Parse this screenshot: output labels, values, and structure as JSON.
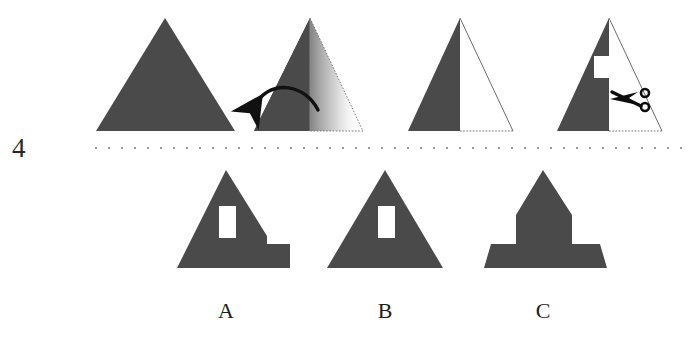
{
  "question": {
    "number": "4",
    "type": "paper-folding",
    "fill_color": "#4a4a4a",
    "outline_color": "#5a5a5a",
    "dash_color": "#8d8d8d",
    "background": "#ffffff"
  },
  "prompt_sequence": {
    "steps": [
      {
        "index": 1,
        "name": "unfolded-sheet",
        "description": "Solid gray equilateral triangle, unfolded paper",
        "icons": []
      },
      {
        "index": 2,
        "name": "fold-action",
        "description": "Right half of triangle folding leftwards over the vertical centre crease",
        "icons": [
          "fold-arrow-icon"
        ]
      },
      {
        "index": 3,
        "name": "folded-sheet",
        "description": "Paper folded in half; left half solid, right half shown as dotted outline",
        "icons": []
      },
      {
        "index": 4,
        "name": "cut-action",
        "description": "Rectangular notch cut out of the folded edge near mid height",
        "icons": [
          "scissors-icon"
        ]
      }
    ]
  },
  "options": [
    {
      "id": "A",
      "label": "A",
      "name": "option-a",
      "description": "Triangle with a white rectangular hole left of centre and a stepped bump on the lower right edge"
    },
    {
      "id": "B",
      "label": "B",
      "name": "option-b",
      "description": "Plain triangle with a single white rectangular hole left of centre"
    },
    {
      "id": "C",
      "label": "C",
      "name": "option-c",
      "description": "Narrow spire shape with a wide stepped base on both sides"
    }
  ],
  "divider": {
    "name": "dotted-divider",
    "style": "dotted",
    "color": "#9a9a9a"
  }
}
